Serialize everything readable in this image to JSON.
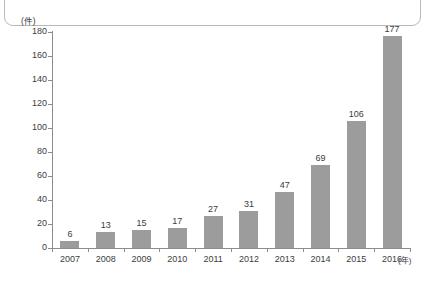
{
  "chart_data": {
    "type": "bar",
    "title": "",
    "subtitle": "",
    "xlabel": "(年)",
    "ylabel": "(件)",
    "categories": [
      "2007",
      "2008",
      "2009",
      "2010",
      "2011",
      "2012",
      "2013",
      "2014",
      "2015",
      "2016"
    ],
    "values": [
      6,
      13,
      15,
      17,
      27,
      31,
      47,
      69,
      106,
      177
    ],
    "value_labels": [
      "6",
      "13",
      "15",
      "17",
      "27",
      "31",
      "47",
      "69",
      "106",
      "177"
    ],
    "ylim": [
      0,
      180
    ],
    "ytick_labels": [
      "0",
      "20",
      "40",
      "60",
      "80",
      "100",
      "120",
      "140",
      "160",
      "180"
    ],
    "ytick_values": [
      0,
      20,
      40,
      60,
      80,
      100,
      120,
      140,
      160,
      180
    ],
    "grid": false,
    "legend": null,
    "legend_position": "none",
    "series": [
      {
        "name": "件数",
        "values": [
          6,
          13,
          15,
          17,
          27,
          31,
          47,
          69,
          106,
          177
        ]
      }
    ],
    "colors": {
      "bar": "#9c9c9c",
      "axis": "#8c8c8c",
      "text": "#3c3c3c",
      "panel_border": "#b9b9b9",
      "background": "#ffffff"
    }
  }
}
